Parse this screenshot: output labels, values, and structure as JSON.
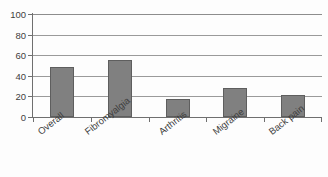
{
  "chart_data": {
    "type": "bar",
    "title": "",
    "subtitle": "",
    "xlabel": "",
    "ylabel": "",
    "categories": [
      "Overall",
      "Fibromyalgia",
      "Arthritis",
      "Migraine",
      "Back pain"
    ],
    "values": [
      49,
      55,
      18,
      28,
      21
    ],
    "series": [
      {
        "name": "",
        "values": [
          49,
          55,
          18,
          28,
          21
        ]
      }
    ],
    "ylim": [
      0,
      100
    ],
    "y_ticks": [
      0,
      20,
      40,
      60,
      80,
      100
    ],
    "y_tick_labels": [
      "0",
      "20",
      "40",
      "60",
      "80",
      "100"
    ],
    "grid": true,
    "grid_orientation": "horizontal",
    "legend": false,
    "legend_position": "none",
    "bar_color": "#808080",
    "bar_edge_color": "#5e5e5e",
    "axis_color": "#6f6f6f",
    "gridline_color": "#9a9a9a",
    "text_color": "#3d3d3d",
    "background_color": "#ffffff",
    "x_label_rotation": -38,
    "annotations": [],
    "data_labels": false
  }
}
